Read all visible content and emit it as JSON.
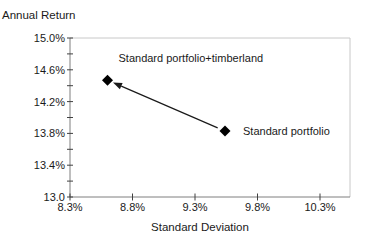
{
  "chart_data": {
    "type": "scatter",
    "title": "",
    "ylabel": "Annual Return",
    "xlabel": "Standard Deviation",
    "x_axis": {
      "min": 8.3,
      "max": 10.3,
      "ticks": [
        8.3,
        8.8,
        9.3,
        9.8,
        10.3
      ],
      "tick_labels": [
        "8.3%",
        "8.8%",
        "9.3%",
        "9.8%",
        "10.3%"
      ]
    },
    "y_axis": {
      "min": 13.0,
      "max": 15.0,
      "minor_step": 0.2,
      "labeled_ticks": [
        15.0,
        14.6,
        14.2,
        13.8,
        13.4,
        13.0
      ],
      "tick_labels": [
        "15.0%",
        "14.6%",
        "14.2%",
        "13.8%",
        "13.4%",
        "13.0"
      ]
    },
    "grid": "off",
    "legend": "none",
    "series": [
      {
        "name": "Standard portfolio",
        "x": 9.54,
        "y": 13.83,
        "marker": "diamond",
        "label_offset": {
          "dx": 18,
          "dy": 4
        }
      },
      {
        "name": "Standard portfolio+timberland",
        "x": 8.6,
        "y": 14.47,
        "marker": "diamond",
        "label_offset": {
          "dx": 11,
          "dy": -18
        }
      }
    ],
    "annotation": {
      "arrow_from": "Standard portfolio",
      "arrow_to": "Standard portfolio+timberland"
    },
    "colors": {
      "marker": "#000000",
      "arrow": "#1a1a1a",
      "axis": "#7f7f7f",
      "tick": "#404040",
      "border": "#c8c8c8",
      "text": "#1a1a1a"
    }
  }
}
